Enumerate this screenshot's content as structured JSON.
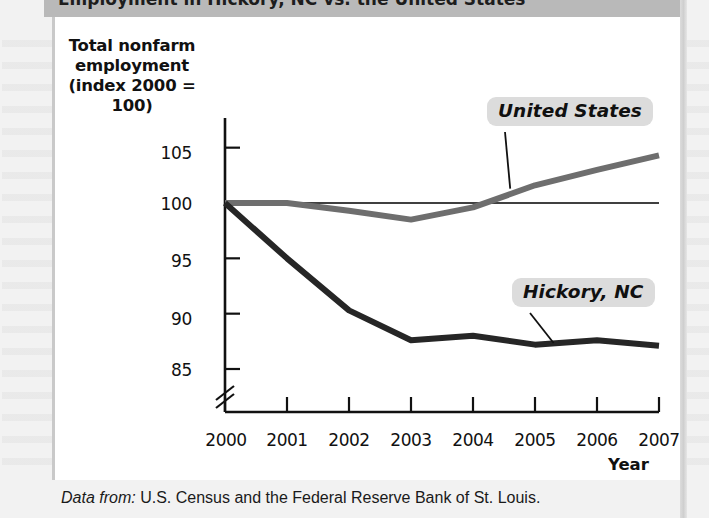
{
  "figure": {
    "header_title_partial": "Employment in Hickory, NC vs. the United States",
    "source_prefix": "Data from:",
    "source_text": "U.S. Census and the Federal Reserve Bank of St. Louis."
  },
  "chart_data": {
    "type": "line",
    "title": "",
    "xlabel": "Year",
    "ylabel": "Total nonfarm employment (index 2000 = 100)",
    "ylabel_lines": [
      "Total nonfarm",
      "employment",
      "(index 2000 = 100)"
    ],
    "x": [
      2000,
      2001,
      2002,
      2003,
      2004,
      2005,
      2006,
      2007
    ],
    "categories": [
      "2000",
      "2001",
      "2002",
      "2003",
      "2004",
      "2005",
      "2006",
      "2007"
    ],
    "ylim": [
      83.5,
      106.5
    ],
    "yticks": [
      105,
      100,
      95,
      90,
      85
    ],
    "ytick_labels": [
      "105",
      "100",
      "95",
      "90",
      "85"
    ],
    "axis_break": true,
    "axis_break_below": 85,
    "grid": false,
    "legend_position": "inline-callouts",
    "reference_line": {
      "value": 100,
      "color": "#000000",
      "width": 1.6
    },
    "series": [
      {
        "name": "United States",
        "color": "#6e6e6e",
        "width": 6,
        "values": [
          100.0,
          100.0,
          99.3,
          98.5,
          99.6,
          101.6,
          103.0,
          104.3
        ]
      },
      {
        "name": "Hickory, NC",
        "color": "#262626",
        "width": 6,
        "values": [
          100.0,
          95.0,
          90.3,
          87.6,
          88.0,
          87.2,
          87.6,
          87.1
        ]
      }
    ],
    "annotations": [
      {
        "label": "United States",
        "anchor_x": 2004.6,
        "anchor_y": 101.3
      },
      {
        "label": "Hickory, NC",
        "anchor_x": 2005.3,
        "anchor_y": 87.35
      }
    ]
  },
  "colors": {
    "united_states": "#6e6e6e",
    "hickory": "#262626",
    "callout_bg": "#dcdcdc",
    "header_bar": "#b9b9b9",
    "page_bg": "#f2f2f2"
  }
}
